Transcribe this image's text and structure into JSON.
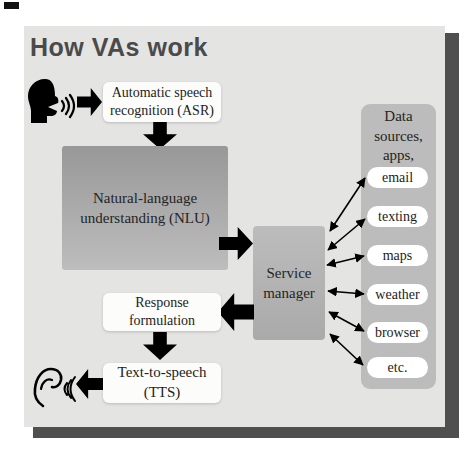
{
  "title": "How VAs work",
  "flow": {
    "asr": "Automatic speech\nrecognition (ASR)",
    "nlu": "Natural-language\nunderstanding (NLU)",
    "service_manager": "Service\nmanager",
    "response": "Response\nformulation",
    "tts": "Text-to-speech\n(TTS)"
  },
  "data_sources": {
    "header": "Data\nsources,\napps,\nwebsites",
    "items": [
      "email",
      "texting",
      "maps",
      "weather",
      "browser",
      "etc."
    ]
  },
  "icons": {
    "speaker": "speaking-head-icon",
    "ear": "listening-ear-icon"
  },
  "colors": {
    "panel": "#e4e4e2",
    "panel_shadow": "#4f4f4f",
    "title_text": "#4a4a4a",
    "nlu_gradient_top": "#989898",
    "nlu_gradient_bottom": "#bdbdbd",
    "service_box": "#b3b3b3",
    "data_box": "#bcbcbc",
    "arrow": "#000000",
    "white_box": "#fcfcfa"
  }
}
